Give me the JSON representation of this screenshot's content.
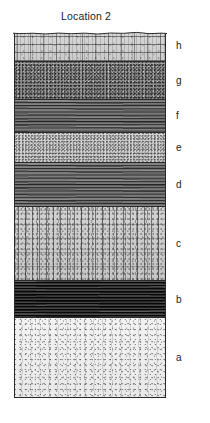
{
  "figure": {
    "title": "Location 2",
    "column": {
      "left": 14,
      "top": 31,
      "width": 152,
      "height": 367
    },
    "layers": [
      {
        "label": "h",
        "texture": "brick-fractured-light",
        "description": "light grey fractured brick-like bedded unit with irregular eroded top surface",
        "top": 0,
        "height": 31,
        "label_center_y": 46
      },
      {
        "label": "g",
        "texture": "stipple-medium",
        "description": "medium grey dense stippled unit",
        "top": 31,
        "height": 38,
        "label_center_y": 81
      },
      {
        "label": "f",
        "texture": "laminated-dark",
        "description": "dark grey horizontally laminated unit",
        "top": 69,
        "height": 33,
        "label_center_y": 116
      },
      {
        "label": "e",
        "texture": "stipple-light",
        "description": "light grey finely stippled unit",
        "top": 102,
        "height": 30,
        "label_center_y": 148
      },
      {
        "label": "d",
        "texture": "laminated-dark",
        "description": "dark grey horizontally laminated unit",
        "top": 132,
        "height": 44,
        "label_center_y": 185
      },
      {
        "label": "c",
        "texture": "cracked-light",
        "description": "light grey unit with vertical fracture pattern, thickest layer",
        "top": 176,
        "height": 74,
        "label_center_y": 244
      },
      {
        "label": "b",
        "texture": "laminated-very-dark",
        "description": "very dark laminated unit",
        "top": 250,
        "height": 37,
        "label_center_y": 300
      },
      {
        "label": "a",
        "texture": "speckle-pale",
        "description": "near-white sparsely speckled basal unit",
        "top": 287,
        "height": 80,
        "label_center_y": 358
      }
    ]
  }
}
